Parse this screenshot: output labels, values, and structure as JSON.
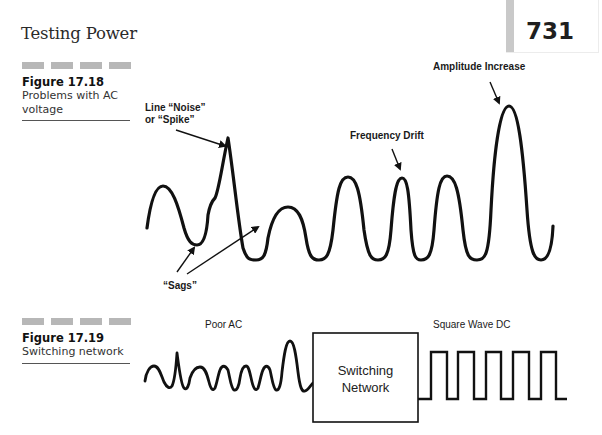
{
  "header": {
    "running_title": "Testing Power",
    "page_number": "731"
  },
  "figure_17_18": {
    "label": "Figure 17.18",
    "caption": "Problems with AC voltage",
    "annotations": {
      "noise_line1": "Line “Noise”",
      "noise_line2": "or “Spike”",
      "frequency_drift": "Frequency Drift",
      "amplitude_increase": "Amplitude Increase",
      "sags": "“Sags”"
    }
  },
  "figure_17_19": {
    "label": "Figure 17.19",
    "caption": "Switching network",
    "input_label": "Poor AC",
    "box_line1": "Switching",
    "box_line2": "Network",
    "output_label": "Square Wave DC"
  },
  "colors": {
    "ink": "#111111",
    "dash_gray": "#b7b7b7",
    "page_tab_gray": "#c9c9c9"
  }
}
